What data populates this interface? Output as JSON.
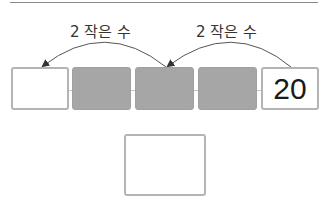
{
  "diagram": {
    "type": "number-sequence-skip-backward",
    "boxes": [
      {
        "state": "empty",
        "value": ""
      },
      {
        "state": "hidden",
        "value": ""
      },
      {
        "state": "hidden",
        "value": ""
      },
      {
        "state": "hidden",
        "value": ""
      },
      {
        "state": "given",
        "value": "20"
      }
    ],
    "arrows": [
      {
        "from_box": 5,
        "to_box": 3,
        "label": "2 작은 수"
      },
      {
        "from_box": 3,
        "to_box": 1,
        "label": "2 작은 수"
      }
    ],
    "answer_box": {
      "value": ""
    },
    "colors": {
      "box_border": "#b4b4b4",
      "hidden_fill": "#a6a6a6",
      "arrow": "#333333",
      "text": "#1a1a1a"
    }
  }
}
